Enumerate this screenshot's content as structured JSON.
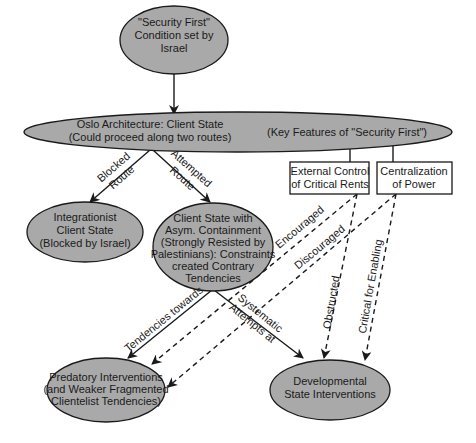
{
  "nodes": {
    "security_first": {
      "lines": [
        "\"Security First\"",
        "Condition set by",
        "Israel"
      ]
    },
    "oslo": {
      "lines": [
        "Oslo Architecture: Client State",
        "(Could proceed along two routes)"
      ],
      "key_features": "(Key Features of \"Security First\")"
    },
    "external_control": {
      "lines": [
        "External Control",
        "of Critical Rents"
      ]
    },
    "centralization": {
      "lines": [
        "Centralization",
        "of Power"
      ]
    },
    "integrationist": {
      "lines": [
        "Integrationist",
        "Client State",
        "(Blocked by Israel)"
      ]
    },
    "asym": {
      "lines": [
        "Client State with",
        "Asym. Containment",
        "(Strongly Resisted by",
        "Palestinians): Constraints",
        "created Contrary",
        "Tendencies"
      ]
    },
    "predatory": {
      "lines": [
        "Predatory Interventions",
        "(and Weaker Fragmented",
        "Clientelist Tendencies)"
      ]
    },
    "developmental": {
      "lines": [
        "Developmental",
        "State Interventions"
      ]
    }
  },
  "edges": {
    "blocked": [
      "Blocked",
      "Route"
    ],
    "attempted": [
      "Attempted",
      "Route"
    ],
    "tendencies": "Tendencies towards",
    "systematic": [
      "Systematic",
      "Attempts at"
    ],
    "encouraged": "Encouraged",
    "discouraged": "Discouraged",
    "obstructed": "Obstructed",
    "critical": "Critical for Enabling"
  },
  "colors": {
    "node_fill": "#a9a9a9",
    "stroke": "#1a1a1a",
    "background": "#ffffff"
  }
}
